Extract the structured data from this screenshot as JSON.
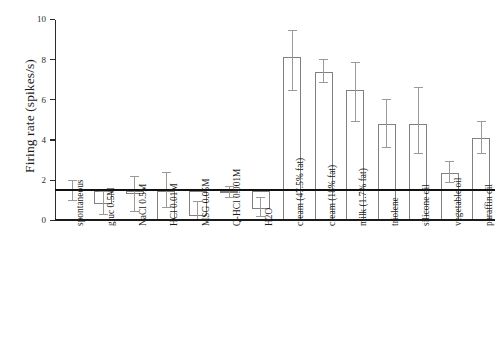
{
  "chart_data": {
    "type": "bar",
    "title": "",
    "xlabel": "",
    "ylabel": "Firing rate (spikes/s)",
    "ylim": [
      0,
      10
    ],
    "yticks": [
      0,
      2,
      4,
      6,
      8,
      10
    ],
    "ytick_labels": [
      "0",
      "2",
      "4",
      "6",
      "8",
      "10"
    ],
    "grid": false,
    "legend": null,
    "reference_line": {
      "value": 1.5,
      "label": "spontaneous firing rate"
    },
    "error_type": "SEM/SD whiskers",
    "categories": [
      "spontaneous",
      "gluc 0.5M",
      "NaCl 0.5M",
      "HCl 0.01M",
      "MSG 0.05M",
      "Q-HCl 0.001M",
      "H2O",
      "cream (47.5% fat)",
      "cream (18% fat)",
      "milk (1.7% fat)",
      "triolene",
      "silicone oil",
      "vegetable oil",
      "paraffin oil"
    ],
    "values": [
      1.5,
      0.85,
      1.35,
      1.5,
      0.25,
      1.4,
      0.6,
      8.15,
      7.4,
      6.5,
      4.85,
      4.85,
      2.4,
      4.15
    ],
    "err_low": [
      1.0,
      0.3,
      0.45,
      0.65,
      0.05,
      1.15,
      0.2,
      6.45,
      6.85,
      4.95,
      3.65,
      3.35,
      1.9,
      3.35
    ],
    "err_high": [
      2.0,
      1.45,
      2.2,
      2.4,
      0.95,
      1.7,
      1.15,
      9.45,
      8.0,
      7.85,
      6.0,
      6.6,
      2.95,
      4.95
    ],
    "bars_drawn": [
      false,
      true,
      true,
      true,
      true,
      true,
      true,
      true,
      true,
      true,
      true,
      true,
      true,
      true
    ]
  }
}
